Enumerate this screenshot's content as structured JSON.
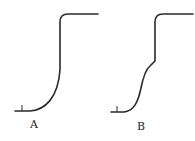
{
  "diagram": {
    "type": "sigmoid-curves-comparison",
    "curves": [
      {
        "id": "A",
        "label": "A",
        "shape": "single-step rise: flat baseline, smooth concave rise to vertical, rounded corner into flat top plateau"
      },
      {
        "id": "B",
        "label": "B",
        "shape": "two-step rise: flat baseline, S-shaped first rise to an intermediate shoulder, then vertical rise with rounded corner into flat top plateau"
      }
    ],
    "colors": {
      "stroke": "#2a2a2a",
      "background": "#ffffff",
      "text": "#222222"
    }
  }
}
